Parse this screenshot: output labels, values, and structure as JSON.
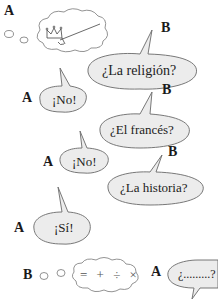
{
  "speakers": {
    "a1": "A",
    "b1": "B",
    "a2": "A",
    "b2": "B",
    "a3": "A",
    "b3": "B",
    "a4": "A",
    "b4": "B",
    "a5": "A"
  },
  "bubbles": {
    "thought_a_icon": "crown-and-sword",
    "religion": "¿La religión?",
    "no1": "¡No!",
    "frances": "¿El francés?",
    "no2": "¡No!",
    "historia": "¿La historia?",
    "si": "¡Sí!",
    "thought_b_symbols": "= + ÷ ×",
    "question": "¿.........?"
  },
  "colors": {
    "bubble_fill": "#ececec",
    "bubble_stroke": "#6a6a6a",
    "text": "#222222"
  }
}
